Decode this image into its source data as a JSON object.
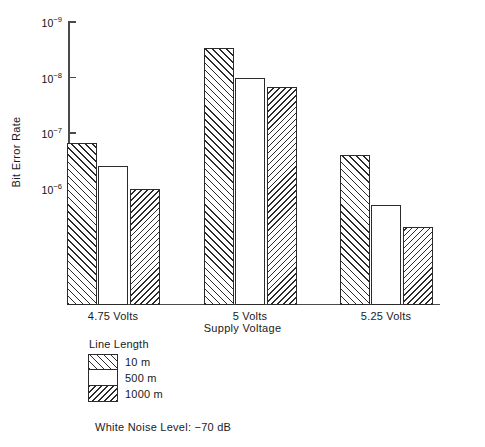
{
  "chart_data": {
    "type": "bar",
    "title": "",
    "xlabel": "Supply Voltage",
    "ylabel": "Bit Error Rate",
    "categories": [
      "4.75 Volts",
      "5 Volts",
      "5.25 Volts"
    ],
    "y_axis": {
      "scale": "log",
      "inverted": true,
      "tick_labels": [
        "10−9",
        "10−8",
        "10−7",
        "10−6"
      ],
      "tick_mantissas": [
        "10",
        "10",
        "10",
        "10"
      ],
      "tick_exponents": [
        "−9",
        "−8",
        "−7",
        "−6"
      ],
      "ylim_top": 1e-09,
      "ylim_bottom_visible": 3e-06,
      "grid": false
    },
    "legend": {
      "title": "Line Length",
      "position": "below-left",
      "entries": [
        {
          "label": "10 m",
          "pattern": "hatch-fwd"
        },
        {
          "label": "500 m",
          "pattern": "hatch-none"
        },
        {
          "label": "1000 m",
          "pattern": "hatch-back"
        }
      ]
    },
    "series": [
      {
        "name": "10 m",
        "pattern": "hatch-fwd",
        "values": [
          1.5e-07,
          3e-09,
          2.5e-07
        ]
      },
      {
        "name": "500 m",
        "pattern": "hatch-none",
        "values": [
          4e-07,
          1e-08,
          2e-06
        ]
      },
      {
        "name": "1000 m",
        "pattern": "hatch-back",
        "values": [
          1e-06,
          1.5e-08,
          5e-06
        ]
      }
    ],
    "annotations": [
      "White Noise Level:  −70 dB"
    ]
  },
  "notes": {
    "white_noise_level": "White Noise Level:  −70 dB"
  },
  "caption": {
    "partial_text": ""
  }
}
